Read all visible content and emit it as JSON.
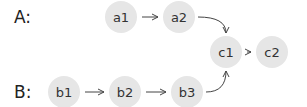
{
  "lists": [
    {
      "label": "A:",
      "nodes": [
        "a1",
        "a2"
      ]
    },
    {
      "label": "B:",
      "nodes": [
        "b1",
        "b2",
        "b3"
      ]
    }
  ],
  "shared_nodes": [
    "c1",
    "c2"
  ],
  "edges": [
    [
      "a1",
      "a2"
    ],
    [
      "a2",
      "c1"
    ],
    [
      "b1",
      "b2"
    ],
    [
      "b2",
      "b3"
    ],
    [
      "b3",
      "c1"
    ],
    [
      "c1",
      "c2"
    ]
  ],
  "colors": {
    "node_fill": "#e6e6e6",
    "text": "#333333",
    "edge": "#444444"
  }
}
